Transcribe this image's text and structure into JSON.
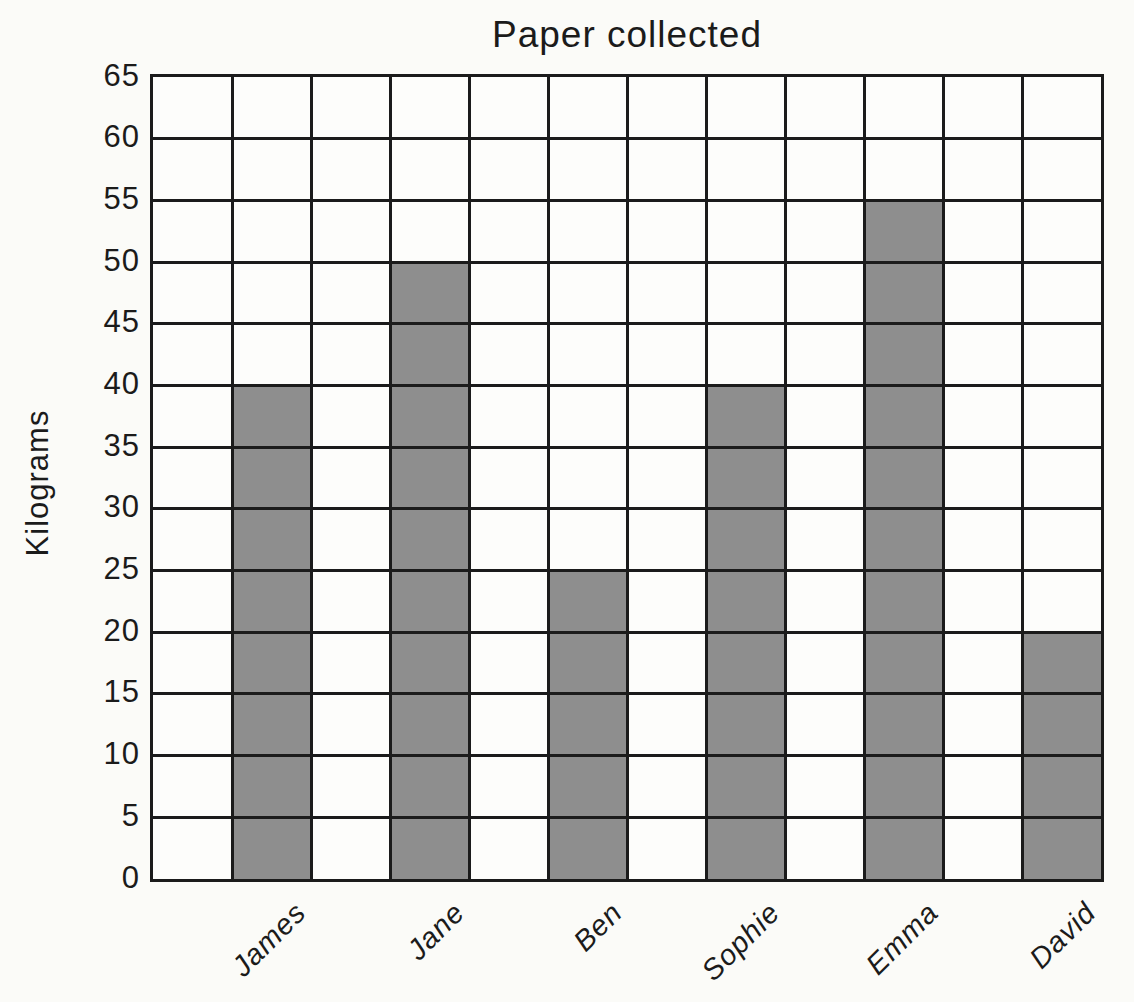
{
  "figure": {
    "background": "#fbfbf8",
    "line_color": "#1b1b1b",
    "bar_color": "#8e8e8e"
  },
  "chart_data": {
    "type": "bar",
    "title": "Paper collected",
    "ylabel": "Kilograms",
    "categories": [
      "James",
      "Jane",
      "Ben",
      "Sophie",
      "Emma",
      "David"
    ],
    "values": [
      40,
      50,
      25,
      40,
      55,
      20
    ],
    "ylim": [
      0,
      65
    ],
    "ytick_step": 5,
    "yticks": [
      "65",
      "60",
      "55",
      "50",
      "45",
      "40",
      "35",
      "30",
      "25",
      "20",
      "15",
      "10",
      "5",
      "0"
    ],
    "grid": true,
    "legend": false,
    "bar_color": "#8e8e8e",
    "line_color": "#1b1b1b"
  }
}
